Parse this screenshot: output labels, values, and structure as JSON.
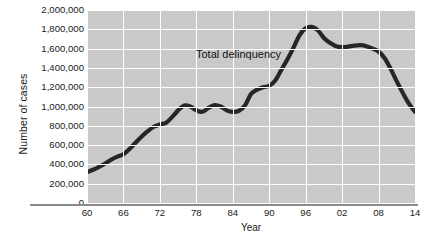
{
  "chart_data": {
    "type": "line",
    "title": "",
    "xlabel": "Year",
    "ylabel": "Number of cases",
    "xlim": [
      1960,
      2014
    ],
    "ylim": [
      0,
      2000000
    ],
    "grid": true,
    "legend_position": "inline-annotation",
    "annotations": [
      {
        "text": "Total delinquency",
        "x": 1983,
        "y": 1620000
      }
    ],
    "xtick_labels": [
      "60",
      "66",
      "72",
      "78",
      "84",
      "90",
      "96",
      "02",
      "08",
      "14"
    ],
    "xtick_values": [
      1960,
      1966,
      1972,
      1978,
      1984,
      1990,
      1996,
      2002,
      2008,
      2014
    ],
    "ytick_labels": [
      "2,000,000",
      "1,800,000",
      "1,600,000",
      "1,400,000",
      "1,200,000",
      "1,000,000",
      "800,000",
      "600,000",
      "400,000",
      "200,000",
      "0"
    ],
    "ytick_values": [
      2000000,
      1800000,
      1600000,
      1400000,
      1200000,
      1000000,
      800000,
      600000,
      400000,
      200000,
      0
    ],
    "series": [
      {
        "name": "Total delinquency",
        "color": "#262626",
        "x": [
          1960,
          1961,
          1962,
          1963,
          1964,
          1965,
          1966,
          1967,
          1968,
          1969,
          1970,
          1971,
          1972,
          1973,
          1974,
          1975,
          1976,
          1977,
          1978,
          1979,
          1980,
          1981,
          1982,
          1983,
          1984,
          1985,
          1986,
          1987,
          1988,
          1989,
          1990,
          1991,
          1992,
          1993,
          1994,
          1995,
          1996,
          1997,
          1998,
          1999,
          2000,
          2001,
          2002,
          2003,
          2004,
          2005,
          2006,
          2007,
          2008,
          2009,
          2010,
          2011,
          2012,
          2013,
          2014
        ],
        "values": [
          320000,
          345000,
          375000,
          410000,
          450000,
          480000,
          505000,
          560000,
          625000,
          690000,
          745000,
          790000,
          815000,
          830000,
          890000,
          960000,
          1010000,
          1000000,
          960000,
          945000,
          985000,
          1015000,
          1000000,
          960000,
          945000,
          955000,
          1010000,
          1130000,
          1175000,
          1200000,
          1215000,
          1270000,
          1380000,
          1490000,
          1610000,
          1740000,
          1810000,
          1825000,
          1790000,
          1710000,
          1660000,
          1625000,
          1615000,
          1620000,
          1630000,
          1635000,
          1625000,
          1600000,
          1570000,
          1500000,
          1390000,
          1260000,
          1140000,
          1030000,
          945000
        ]
      }
    ]
  }
}
